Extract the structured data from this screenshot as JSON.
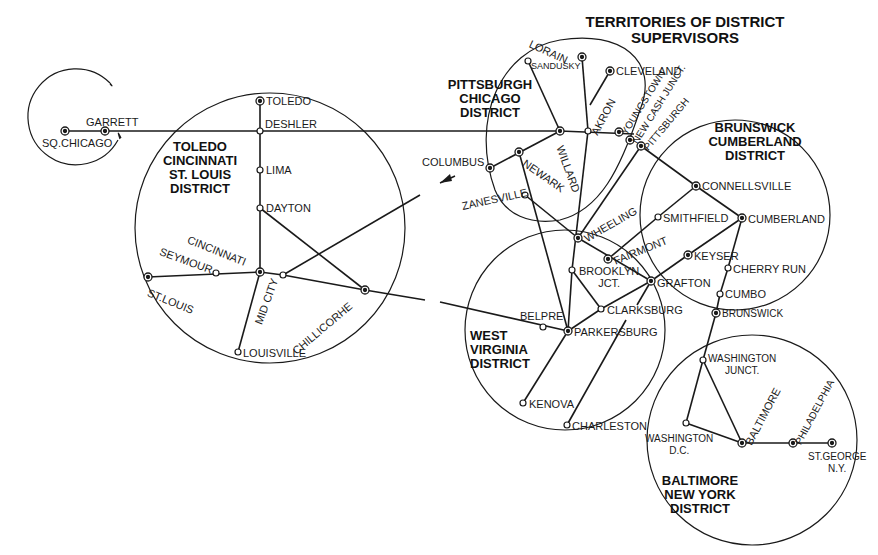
{
  "title": "TERRITORIES OF DISTRICT\nSUPERVISORS",
  "colors": {
    "ink": "#1a1a1a",
    "background": "#ffffff"
  },
  "districts": [
    {
      "id": "toledo",
      "label": "TOLEDO\nCINCINNATI\nST. LOUIS\nDISTRICT"
    },
    {
      "id": "pittsburgh",
      "label": "PITTSBURGH\nCHICAGO\nDISTRICT"
    },
    {
      "id": "brunswick",
      "label": "BRUNSWICK\nCUMBERLAND\nDISTRICT"
    },
    {
      "id": "westvirginia",
      "label": "WEST\nVIRGINIA\nDISTRICT"
    },
    {
      "id": "baltimore",
      "label": "BALTIMORE\nNEW YORK\nDISTRICT"
    }
  ],
  "stations": {
    "sq_chicago": "SQ.CHICAGO",
    "garrett": "GARRETT",
    "toledo": "TOLEDO",
    "deshler": "DESHLER",
    "lima": "LIMA",
    "dayton": "DAYTON",
    "cincinnati": "CINCINNATI",
    "seymour": "SEYMOUR",
    "st_louis": "ST.LOUIS",
    "mid_city": "MID CITY",
    "louisville": "LOUISVILLE",
    "chillicothe": "CHILLICORHE",
    "lorain": "LORAIN",
    "sandusky": "SANDUSKY",
    "cleveland": "CLEVELAND",
    "akron": "AKRON",
    "youngstown": "YOUNGSTOWN",
    "new_castle": "NEW CASH JUNCT.",
    "pittsburgh": "PITTSBURGH",
    "willard": "WILLARD",
    "columbus": "COLUMBUS",
    "newark": "NEWARK",
    "zanesville": "ZANESVILLE",
    "wheeling": "WHEELING",
    "fairmont": "FAIRMONT",
    "brooklyn_jct": "BROOKLYN\nJCT.",
    "grafton": "GRAFTON",
    "clarksburg": "CLARKSBURG",
    "belpre": "BELPRE",
    "parkersburg": "PARKERSBURG",
    "kenova": "KENOVA",
    "charleston": "CHARLESTON",
    "connellsville": "CONNELLSVILLE",
    "smithfield": "SMITHFIELD",
    "cumberland": "CUMBERLAND",
    "keyser": "KEYSER",
    "cherry_run": "CHERRY RUN",
    "cumbo": "CUMBO",
    "brunswick": "BRUNSWICK",
    "washington_junct": "WASHINGTON\nJUNCT.",
    "washington_dc": "WASHINGTON\nD.C.",
    "baltimore": "BALTIMORE",
    "philadelphia": "PHILADELPHIA",
    "st_george": "ST.GEORGE\nN.Y."
  }
}
